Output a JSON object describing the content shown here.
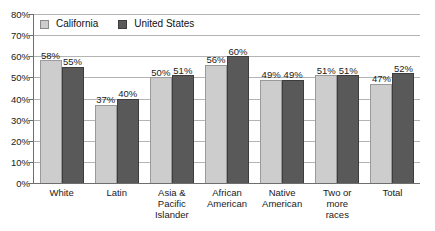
{
  "chart_data": {
    "type": "bar",
    "title": "",
    "xlabel": "",
    "ylabel": "",
    "ylim": [
      0,
      80
    ],
    "grid": true,
    "legend_position": "top-left",
    "ytick_labels": [
      "80%",
      "70%",
      "60%",
      "50%",
      "40%",
      "30%",
      "20%",
      "10%",
      "0%"
    ],
    "ytick_values": [
      80,
      70,
      60,
      50,
      40,
      30,
      20,
      10,
      0
    ],
    "categories": [
      "White",
      "Latin",
      "Asia & Pacific Islander",
      "African American",
      "Native American",
      "Two or more races",
      "Total"
    ],
    "category_lines": [
      [
        "White"
      ],
      [
        "Latin"
      ],
      [
        "Asia &",
        "Pacific",
        "Islander"
      ],
      [
        "African",
        "American"
      ],
      [
        "Native",
        "American"
      ],
      [
        "Two or",
        "more",
        "races"
      ],
      [
        "Total"
      ]
    ],
    "series": [
      {
        "name": "California",
        "color": "#cdcdcd",
        "values": [
          58,
          37,
          50,
          56,
          49,
          51,
          47
        ],
        "labels": [
          "58%",
          "37%",
          "50%",
          "56%",
          "49%",
          "51%",
          "47%"
        ]
      },
      {
        "name": "United States",
        "color": "#595959",
        "values": [
          55,
          40,
          51,
          60,
          49,
          51,
          52
        ],
        "labels": [
          "55%",
          "40%",
          "51%",
          "60%",
          "49%",
          "51%",
          "52%"
        ]
      }
    ]
  },
  "legend": {
    "items": [
      {
        "label": "California",
        "swatch": "ca"
      },
      {
        "label": "United States",
        "swatch": "us"
      }
    ]
  }
}
